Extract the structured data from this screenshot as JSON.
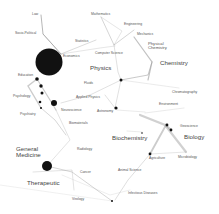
{
  "colors": {
    "background": "#ffffff",
    "node": "#111111",
    "edge": "#9a9a9a",
    "label": "#555555"
  },
  "major_labels": [
    {
      "id": "physics",
      "text": "Physics",
      "x": 100,
      "y": 67
    },
    {
      "id": "chemistry",
      "text": "Chemistry",
      "x": 160,
      "y": 62
    },
    {
      "id": "biochemistry",
      "text": "Biochemistry",
      "x": 112,
      "y": 138
    },
    {
      "id": "biology",
      "text": "Biology",
      "x": 184,
      "y": 136
    },
    {
      "id": "general-medicine",
      "text": "General\nMedicine",
      "x": 16,
      "y": 148
    },
    {
      "id": "therapeutic",
      "text": "Therapeutic",
      "x": 28,
      "y": 182
    },
    {
      "id": "physical-chemistry",
      "text": "Physical\nChemistry",
      "x": 148,
      "y": 43
    }
  ],
  "minor_labels": [
    {
      "id": "law",
      "text": "Law",
      "x": 34,
      "y": 14
    },
    {
      "id": "mathematics",
      "text": "Mathematics",
      "x": 91,
      "y": 14
    },
    {
      "id": "engineering",
      "text": "Engineering",
      "x": 124,
      "y": 24
    },
    {
      "id": "mechanics",
      "text": "Mechanics",
      "x": 137,
      "y": 34
    },
    {
      "id": "socio-political",
      "text": "Socio-Political",
      "x": 16,
      "y": 33
    },
    {
      "id": "statistics",
      "text": "Statistics",
      "x": 75,
      "y": 41
    },
    {
      "id": "economics",
      "text": "Economics",
      "x": 63,
      "y": 56
    },
    {
      "id": "computer-science",
      "text": "Computer Science",
      "x": 95,
      "y": 53
    },
    {
      "id": "education",
      "text": "Education",
      "x": 18,
      "y": 75
    },
    {
      "id": "fluids",
      "text": "Fluids",
      "x": 84,
      "y": 83
    },
    {
      "id": "psychology",
      "text": "Psychology",
      "x": 13,
      "y": 96
    },
    {
      "id": "applied-physics",
      "text": "Applied Physics",
      "x": 76,
      "y": 97
    },
    {
      "id": "chromatography",
      "text": "Chromatography",
      "x": 172,
      "y": 92
    },
    {
      "id": "psychiatry",
      "text": "Psychiatry",
      "x": 20,
      "y": 114
    },
    {
      "id": "neuroscience",
      "text": "Neuroscience",
      "x": 62,
      "y": 110
    },
    {
      "id": "astronomy",
      "text": "Astronomy",
      "x": 97,
      "y": 111
    },
    {
      "id": "environment",
      "text": "Environment",
      "x": 159,
      "y": 104
    },
    {
      "id": "biomaterials",
      "text": "Biomaterials",
      "x": 69,
      "y": 123
    },
    {
      "id": "geoscience",
      "text": "Geoscience",
      "x": 180,
      "y": 126
    },
    {
      "id": "radiology",
      "text": "Radiology",
      "x": 77,
      "y": 149
    },
    {
      "id": "agriculture",
      "text": "Agriculture",
      "x": 149,
      "y": 158
    },
    {
      "id": "microbiology",
      "text": "Microbiology",
      "x": 178,
      "y": 157
    },
    {
      "id": "cancer",
      "text": "Cancer",
      "x": 80,
      "y": 172
    },
    {
      "id": "animal-science",
      "text": "Animal Science",
      "x": 118,
      "y": 170
    },
    {
      "id": "infectious-diseases",
      "text": "Infectious Diseases",
      "x": 128,
      "y": 193
    },
    {
      "id": "virology",
      "text": "Virology",
      "x": 72,
      "y": 199
    }
  ],
  "nodes": [
    {
      "x": 49,
      "y": 62,
      "r": 13.5
    },
    {
      "x": 37,
      "y": 79,
      "r": 1.8
    },
    {
      "x": 41,
      "y": 86,
      "r": 1.7
    },
    {
      "x": 42,
      "y": 93,
      "r": 1.5
    },
    {
      "x": 54,
      "y": 103,
      "r": 3
    },
    {
      "x": 40,
      "y": 102,
      "r": 1.3
    },
    {
      "x": 41,
      "y": 108,
      "r": 1
    },
    {
      "x": 47,
      "y": 166,
      "r": 5
    },
    {
      "x": 121,
      "y": 80,
      "r": 1.5
    },
    {
      "x": 116,
      "y": 108,
      "r": 1.6
    },
    {
      "x": 167,
      "y": 125,
      "r": 1.4
    },
    {
      "x": 171,
      "y": 130,
      "r": 1.4
    },
    {
      "x": 150,
      "y": 154,
      "r": 1.4
    },
    {
      "x": 112,
      "y": 201,
      "r": 1
    },
    {
      "x": 142,
      "y": 133,
      "r": 0.8
    }
  ]
}
